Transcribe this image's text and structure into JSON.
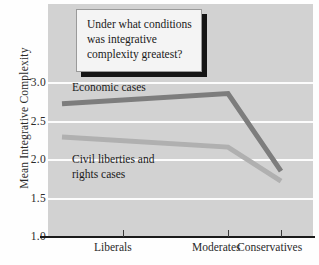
{
  "callout": {
    "text": "Under what conditions\nwas integrative\ncomplexity greatest?"
  },
  "labels": {
    "economic": "Economic cases",
    "civil": "Civil liberties and\nrights cases"
  },
  "axis": {
    "y_title": "Mean Integrative Complexity",
    "y_ticks": [
      "3.0",
      "2.5",
      "2.0",
      "1.5",
      "1.0"
    ],
    "x_ticks": [
      "Liberals",
      "Moderates",
      "Conservatives"
    ]
  },
  "colors": {
    "plot_background": "#d2d2d2",
    "gridline": "#fcfcfc",
    "economic_line": "#7d7d7d",
    "civil_line": "#b0b0b0",
    "axis": "#1b1b1b",
    "callout_shadow": "#141414"
  },
  "chart_data": {
    "type": "line",
    "title": "",
    "xlabel": "",
    "ylabel": "Mean Integrative Complexity",
    "categories": [
      "Liberals",
      "Moderates",
      "Conservatives"
    ],
    "ylim": [
      1.0,
      3.0
    ],
    "yticks": [
      1.0,
      1.5,
      2.0,
      2.5,
      3.0
    ],
    "grid": true,
    "legend": "inline-labels",
    "annotations": [
      "Under what conditions was integrative complexity greatest?"
    ],
    "series": [
      {
        "name": "Economic cases",
        "values": [
          2.72,
          2.85,
          1.85
        ],
        "color": "#7d7d7d"
      },
      {
        "name": "Civil liberties and rights cases",
        "values": [
          2.29,
          2.16,
          1.72
        ],
        "color": "#b0b0b0"
      }
    ]
  }
}
